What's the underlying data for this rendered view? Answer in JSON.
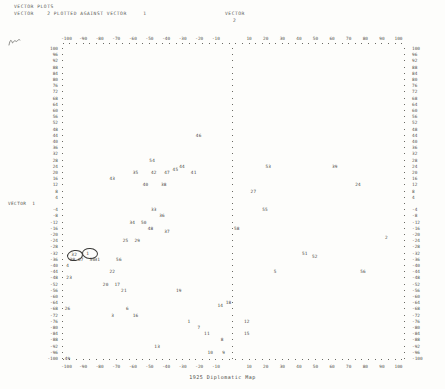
{
  "header": {
    "line1": "VECTOR PLOTS",
    "line2": "VECTOR    2 PLOTTED AGAINST VECTOR     1",
    "right_label": "VECTOR",
    "right_value": "2"
  },
  "axis": {
    "y_axis_name": "VECTOR",
    "y_axis_index": "1",
    "x_ticks": [
      "-100",
      "-90",
      "-80",
      "-70",
      "-60",
      "-50",
      "-40",
      "-30",
      "-20",
      "-10",
      "0",
      "10",
      "20",
      "30",
      "40",
      "50",
      "60",
      "70",
      "80",
      "90",
      "100"
    ],
    "y_ticks": [
      "100",
      "96",
      "92",
      "88",
      "84",
      "80",
      "76",
      "72",
      "68",
      "64",
      "60",
      "56",
      "52",
      "48",
      "44",
      "40",
      "36",
      "32",
      "28",
      "24",
      "20",
      "16",
      "12",
      "8",
      "4",
      "0",
      "-4",
      "-8",
      "-12",
      "-16",
      "-20",
      "-24",
      "-28",
      "-32",
      "-36",
      "-40",
      "-44",
      "-48",
      "-52",
      "-56",
      "-60",
      "-64",
      "-68",
      "-72",
      "-76",
      "-80",
      "-84",
      "-88",
      "-92",
      "-96",
      "-100"
    ],
    "xlim": [
      -110,
      110
    ],
    "ylim": [
      -104,
      104
    ]
  },
  "footer": {
    "caption": "1925 Diplomatic Map"
  },
  "annotations": {
    "margin_mark": "handwritten-squiggle",
    "circles": [
      {
        "label": "circle-around-32",
        "cx": -95,
        "cy": -33
      },
      {
        "label": "circle-around-1",
        "cx": -86,
        "cy": -32
      }
    ]
  },
  "chart_data": {
    "type": "scatter",
    "title": "VECTOR PLOTS",
    "subtitle": "VECTOR 2 PLOTTED AGAINST VECTOR 1",
    "xlabel": "VECTOR 1",
    "ylabel": "VECTOR 2",
    "xlim": [
      -110,
      110
    ],
    "ylim": [
      -104,
      104
    ],
    "grid": false,
    "legend": null,
    "point_label_field": "case number",
    "points": [
      {
        "label": "46",
        "x": -20,
        "y": 44
      },
      {
        "label": "54",
        "x": -48,
        "y": 28
      },
      {
        "label": "44",
        "x": -30,
        "y": 24
      },
      {
        "label": "53",
        "x": 22,
        "y": 24
      },
      {
        "label": "39",
        "x": 62,
        "y": 24
      },
      {
        "label": "35",
        "x": -58,
        "y": 20
      },
      {
        "label": "42",
        "x": -47,
        "y": 20
      },
      {
        "label": "47",
        "x": -39,
        "y": 20
      },
      {
        "label": "45",
        "x": -34,
        "y": 22
      },
      {
        "label": "41",
        "x": -23,
        "y": 20
      },
      {
        "label": "43",
        "x": -72,
        "y": 16
      },
      {
        "label": "40",
        "x": -52,
        "y": 12
      },
      {
        "label": "38",
        "x": -41,
        "y": 12
      },
      {
        "label": "24",
        "x": 76,
        "y": 12
      },
      {
        "label": "27",
        "x": 13,
        "y": 8
      },
      {
        "label": "33",
        "x": -47,
        "y": -4
      },
      {
        "label": "36",
        "x": -42,
        "y": -8
      },
      {
        "label": "55",
        "x": 20,
        "y": -4
      },
      {
        "label": "34",
        "x": -60,
        "y": -12
      },
      {
        "label": "50",
        "x": -53,
        "y": -12
      },
      {
        "label": "48",
        "x": -49,
        "y": -16
      },
      {
        "label": "58",
        "x": 3,
        "y": -16
      },
      {
        "label": "37",
        "x": -39,
        "y": -18
      },
      {
        "label": "25",
        "x": -64,
        "y": -24
      },
      {
        "label": "29",
        "x": -57,
        "y": -24
      },
      {
        "label": "2",
        "x": 94,
        "y": -22
      },
      {
        "label": "32",
        "x": -95,
        "y": -33
      },
      {
        "label": "1",
        "x": -86,
        "y": -32
      },
      {
        "label": "51",
        "x": 44,
        "y": -32
      },
      {
        "label": "28",
        "x": -96,
        "y": -36
      },
      {
        "label": "07",
        "x": -91,
        "y": -36
      },
      {
        "label": "30",
        "x": -84,
        "y": -36
      },
      {
        "label": "31",
        "x": -81,
        "y": -36
      },
      {
        "label": "56",
        "x": -68,
        "y": -36
      },
      {
        "label": "52",
        "x": 50,
        "y": -34
      },
      {
        "label": "4",
        "x": -98,
        "y": -40
      },
      {
        "label": "22",
        "x": -72,
        "y": -44
      },
      {
        "label": "5",
        "x": 27,
        "y": -44
      },
      {
        "label": "56",
        "x": 79,
        "y": -44
      },
      {
        "label": "23",
        "x": -98,
        "y": -48
      },
      {
        "label": "20",
        "x": -76,
        "y": -52
      },
      {
        "label": "17",
        "x": -69,
        "y": -52
      },
      {
        "label": "21",
        "x": -65,
        "y": -56
      },
      {
        "label": "19",
        "x": -32,
        "y": -56
      },
      {
        "label": "18",
        "x": -2,
        "y": -64
      },
      {
        "label": "14",
        "x": -7,
        "y": -66
      },
      {
        "label": "26",
        "x": -99,
        "y": -68
      },
      {
        "label": "6",
        "x": -62,
        "y": -68
      },
      {
        "label": "3",
        "x": -71,
        "y": -72
      },
      {
        "label": "16",
        "x": -58,
        "y": -72
      },
      {
        "label": "12",
        "x": 9,
        "y": -76
      },
      {
        "label": "1",
        "x": -25,
        "y": -76
      },
      {
        "label": "7",
        "x": -19,
        "y": -80
      },
      {
        "label": "11",
        "x": -15,
        "y": -84
      },
      {
        "label": "15",
        "x": 9,
        "y": -84
      },
      {
        "label": "8",
        "x": -5,
        "y": -88
      },
      {
        "label": "13",
        "x": -45,
        "y": -92
      },
      {
        "label": "10",
        "x": -13,
        "y": -96
      },
      {
        "label": "9",
        "x": -4,
        "y": -96
      },
      {
        "label": "49",
        "x": -99,
        "y": -100
      }
    ]
  }
}
